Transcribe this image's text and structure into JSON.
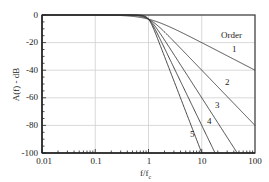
{
  "chart_data": {
    "type": "line",
    "title": "",
    "xlabel": "f/f_c",
    "ylabel": "A(f) - dB",
    "xscale": "log",
    "xlim": [
      0.01,
      100
    ],
    "ylim": [
      -100,
      0
    ],
    "x_ticks": [
      "0.01",
      "0.1",
      "1",
      "10",
      "100"
    ],
    "y_ticks": [
      "0",
      "-20",
      "-40",
      "-60",
      "-80",
      "-100"
    ],
    "grid": true,
    "legend_title": "Order",
    "legend_position": "upper right (inline labels)",
    "series": [
      {
        "name": "1",
        "order": 1,
        "points": [
          [
            0.01,
            0
          ],
          [
            0.1,
            -0.04
          ],
          [
            1,
            -3
          ],
          [
            10,
            -20
          ],
          [
            100,
            -40
          ]
        ]
      },
      {
        "name": "2",
        "order": 2,
        "points": [
          [
            0.01,
            0
          ],
          [
            0.1,
            0
          ],
          [
            1,
            -3
          ],
          [
            10,
            -40
          ],
          [
            100,
            -80
          ]
        ]
      },
      {
        "name": "3",
        "order": 3,
        "points": [
          [
            0.01,
            0
          ],
          [
            0.1,
            0
          ],
          [
            1,
            -3
          ],
          [
            10,
            -60
          ],
          [
            46,
            -100
          ]
        ]
      },
      {
        "name": "4",
        "order": 4,
        "points": [
          [
            0.01,
            0
          ],
          [
            0.1,
            0
          ],
          [
            1,
            -3
          ],
          [
            10,
            -80
          ],
          [
            17.8,
            -100
          ]
        ]
      },
      {
        "name": "5",
        "order": 5,
        "points": [
          [
            0.01,
            0
          ],
          [
            0.1,
            0
          ],
          [
            1,
            -3
          ],
          [
            10,
            -100
          ]
        ]
      }
    ]
  },
  "labels": {
    "legend_title": "Order",
    "curve1": "1",
    "curve2": "2",
    "curve3": "3",
    "curve4": "4",
    "curve5": "5",
    "xlabel_main": "f/f",
    "xlabel_sub": "c",
    "ylabel": "A(f) - dB",
    "y0": "0",
    "y20": "-20",
    "y40": "-40",
    "y60": "-60",
    "y80": "-80",
    "y100": "-100",
    "x001": "0.01",
    "x01": "0.1",
    "x1": "1",
    "x10": "10",
    "x100": "100"
  }
}
